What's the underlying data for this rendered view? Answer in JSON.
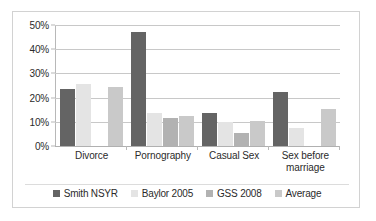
{
  "chart_data": {
    "type": "bar",
    "title": "",
    "subtitle": "",
    "xlabel": "",
    "ylabel": "",
    "ylim": [
      0,
      50
    ],
    "ytick_labels": [
      "0%",
      "10%",
      "20%",
      "30%",
      "40%",
      "50%"
    ],
    "ytick_values": [
      0,
      10,
      20,
      30,
      40,
      50
    ],
    "grid": true,
    "legend_position": "bottom",
    "categories": [
      "Divorce",
      "Pornography",
      "Casual Sex",
      "Sex before marriage"
    ],
    "category_label_lines": [
      [
        "Divorce"
      ],
      [
        "Pornography"
      ],
      [
        "Casual Sex"
      ],
      [
        "Sex before",
        "marriage"
      ]
    ],
    "series": [
      {
        "name": "Smith NSYR",
        "color": "#646464",
        "values": [
          23.5,
          47.0,
          13.5,
          22.5
        ]
      },
      {
        "name": "Baylor 2005",
        "color": "#e4e4e4",
        "values": [
          25.5,
          13.5,
          10.0,
          7.5
        ]
      },
      {
        "name": "GSS 2008",
        "color": "#b2b2b2",
        "values": [
          null,
          11.5,
          5.5,
          null
        ]
      },
      {
        "name": "Average",
        "color": "#c9c9c9",
        "values": [
          24.5,
          12.3,
          10.3,
          15.3
        ]
      }
    ]
  },
  "legend": {
    "items": [
      {
        "label": "Smith NSYR"
      },
      {
        "label": "Baylor 2005"
      },
      {
        "label": "GSS 2008"
      },
      {
        "label": "Average"
      }
    ]
  },
  "axes": {
    "y": {
      "ticks": [
        {
          "label": "50%",
          "value": 50
        },
        {
          "label": "40%",
          "value": 40
        },
        {
          "label": "30%",
          "value": 30
        },
        {
          "label": "20%",
          "value": 20
        },
        {
          "label": "10%",
          "value": 10
        },
        {
          "label": "0%",
          "value": 0
        }
      ]
    }
  }
}
